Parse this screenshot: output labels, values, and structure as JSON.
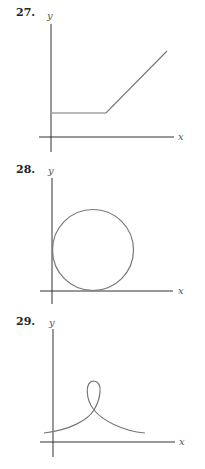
{
  "colors": {
    "axis": "#333333",
    "curve": "#777777",
    "text": "#222222"
  },
  "problems": [
    {
      "number": "27.",
      "x_label": "x",
      "y_label": "y",
      "description": "horizontal segment then rising line"
    },
    {
      "number": "28.",
      "x_label": "x",
      "y_label": "y",
      "description": "circle tangent to both axes"
    },
    {
      "number": "29.",
      "x_label": "x",
      "y_label": "y",
      "description": "curve with a single loop above the crossing point"
    }
  ]
}
